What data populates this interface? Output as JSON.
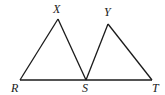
{
  "diagram": {
    "type": "geometry",
    "points": {
      "R": {
        "label": "R",
        "x": 20,
        "y": 80,
        "lx": 11,
        "ly": 92
      },
      "X": {
        "label": "X",
        "x": 58,
        "y": 19,
        "lx": 53,
        "ly": 13
      },
      "S": {
        "label": "S",
        "x": 86,
        "y": 80,
        "lx": 82,
        "ly": 92
      },
      "Y": {
        "label": "Y",
        "x": 108,
        "y": 24,
        "lx": 104,
        "ly": 16
      },
      "T": {
        "label": "T",
        "x": 152,
        "y": 80,
        "lx": 152,
        "ly": 92
      }
    },
    "segments": [
      [
        "R",
        "T"
      ],
      [
        "R",
        "X"
      ],
      [
        "X",
        "S"
      ],
      [
        "S",
        "Y"
      ],
      [
        "Y",
        "T"
      ]
    ],
    "stroke_color": "#1a1a1a"
  }
}
